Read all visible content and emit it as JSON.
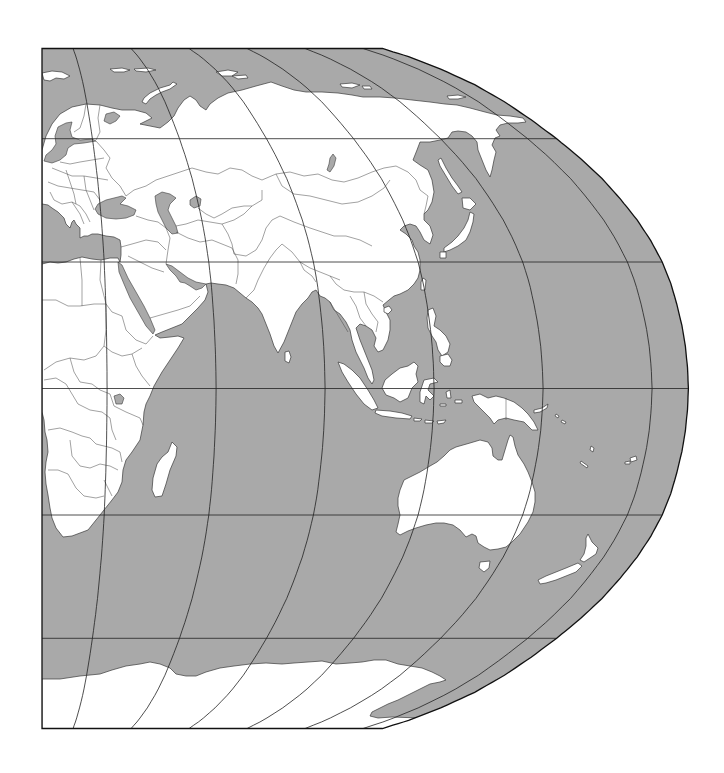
{
  "map": {
    "projection": "robinson",
    "ocean_color": "#a9a9a9",
    "land_color": "#ffffff",
    "coast_color": "#3a3a3a",
    "graticule_color": "#222222",
    "graticule": {
      "parallels_deg": [
        60,
        30,
        0,
        -30,
        -60
      ],
      "meridians_deg": [
        20,
        50,
        80,
        110,
        140,
        170
      ]
    },
    "extent": {
      "lon_min": 10,
      "lon_max": 180,
      "lat_min": -90,
      "lat_max": 90
    },
    "regions_visible": [
      "Europe",
      "Africa",
      "Middle East",
      "Asia",
      "Indonesia",
      "Australia",
      "New Zealand",
      "Antarctica",
      "Indian Ocean",
      "Western Pacific"
    ]
  }
}
